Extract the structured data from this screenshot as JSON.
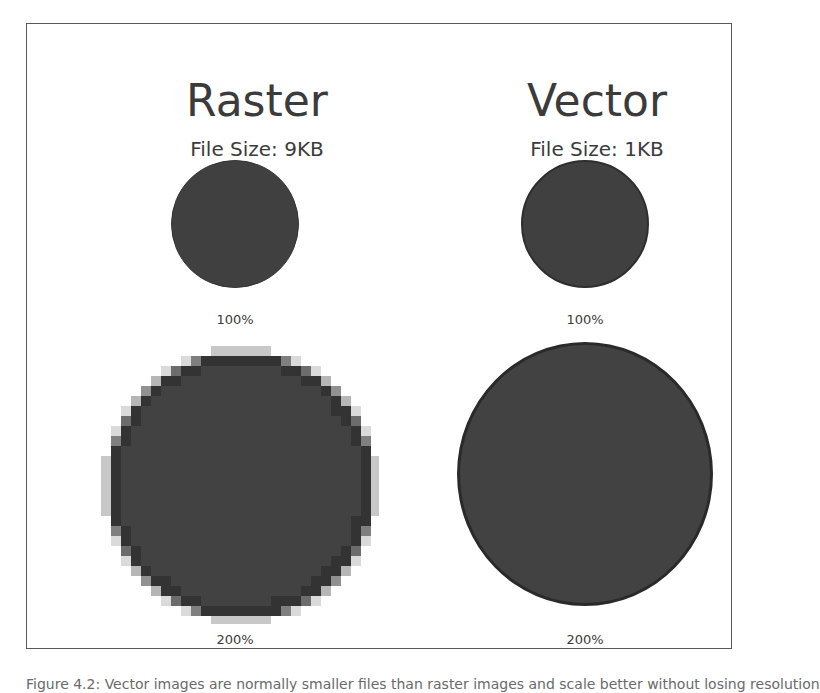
{
  "figure": {
    "columns": [
      {
        "title": "Raster",
        "file_size": "File Size: 9KB",
        "scale_labels": [
          "100%",
          "200%"
        ]
      },
      {
        "title": "Vector",
        "file_size": "File Size: 1KB",
        "scale_labels": [
          "100%",
          "200%"
        ]
      }
    ],
    "colors": {
      "circle_fill": "#3f3f3f",
      "circle_stroke": "#2a2a2a",
      "frame_border": "#5a5a5a",
      "text": "#3b3b3b"
    }
  },
  "caption": "Figure 4.2: Vector images are normally smaller files than raster images and scale better without losing resolution"
}
